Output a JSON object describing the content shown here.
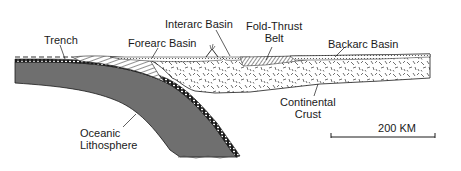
{
  "diagram": {
    "type": "geologic-cross-section",
    "labels": {
      "trench": "Trench",
      "forearc_basin": "Forearc Basin",
      "interarc_basin": "Interarc Basin",
      "fold_thrust_belt": "Fold-Thrust\nBelt",
      "backarc_basin": "Backarc Basin",
      "continental_crust": "Continental\nCrust",
      "oceanic_lithosphere": "Oceanic\nLithosphere"
    },
    "scale_bar": {
      "label": "200 KM",
      "length_px": 106
    },
    "colors": {
      "oceanic_lithosphere": "#6f6f6f",
      "continental_crust": "#ffffff",
      "outline": "#1a1a1a",
      "sea_level_dash": "#333333"
    }
  }
}
